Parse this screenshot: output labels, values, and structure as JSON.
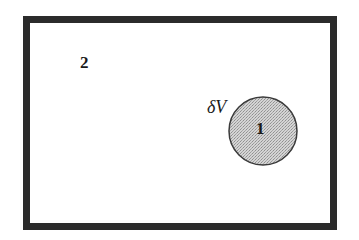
{
  "diagram": {
    "outer_region": {
      "label": "2",
      "border_color": "#2b2b2b",
      "fill_color": "#ffffff"
    },
    "inner_region": {
      "label": "1",
      "volume_label": "δV",
      "fill_color": "#c9c9c9",
      "stroke_color": "#3a3a3a",
      "shape": "circle"
    }
  }
}
